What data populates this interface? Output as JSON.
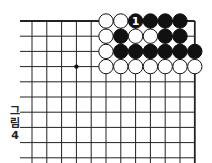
{
  "figure": {
    "caption_chars": [
      "그",
      "림",
      "4"
    ],
    "caption": "그림 4"
  },
  "board": {
    "cols": 12,
    "rows": 10,
    "origin_x": 32,
    "origin_y": 21,
    "spacing_x": 14.8,
    "spacing_y": 15.2,
    "right_edge": true,
    "top_edge": true,
    "star_points": [
      [
        3,
        3
      ]
    ],
    "line_color": "#222222",
    "stones": [
      {
        "col": 5,
        "row": 0,
        "color": "white"
      },
      {
        "col": 6,
        "row": 0,
        "color": "white"
      },
      {
        "col": 7,
        "row": 0,
        "color": "black",
        "label": "1"
      },
      {
        "col": 8,
        "row": 0,
        "color": "black"
      },
      {
        "col": 9,
        "row": 0,
        "color": "black"
      },
      {
        "col": 10,
        "row": 0,
        "color": "black"
      },
      {
        "col": 5,
        "row": 1,
        "color": "white"
      },
      {
        "col": 6,
        "row": 1,
        "color": "black"
      },
      {
        "col": 7,
        "row": 1,
        "color": "white"
      },
      {
        "col": 8,
        "row": 1,
        "color": "white"
      },
      {
        "col": 9,
        "row": 1,
        "color": "black"
      },
      {
        "col": 10,
        "row": 1,
        "color": "black"
      },
      {
        "col": 5,
        "row": 2,
        "color": "white"
      },
      {
        "col": 6,
        "row": 2,
        "color": "black"
      },
      {
        "col": 7,
        "row": 2,
        "color": "black"
      },
      {
        "col": 8,
        "row": 2,
        "color": "black"
      },
      {
        "col": 9,
        "row": 2,
        "color": "black"
      },
      {
        "col": 10,
        "row": 2,
        "color": "black"
      },
      {
        "col": 11,
        "row": 2,
        "color": "black"
      },
      {
        "col": 5,
        "row": 3,
        "color": "white"
      },
      {
        "col": 6,
        "row": 3,
        "color": "white"
      },
      {
        "col": 7,
        "row": 3,
        "color": "white"
      },
      {
        "col": 8,
        "row": 3,
        "color": "white"
      },
      {
        "col": 9,
        "row": 3,
        "color": "white"
      },
      {
        "col": 10,
        "row": 3,
        "color": "white"
      },
      {
        "col": 11,
        "row": 3,
        "color": "white"
      }
    ]
  }
}
